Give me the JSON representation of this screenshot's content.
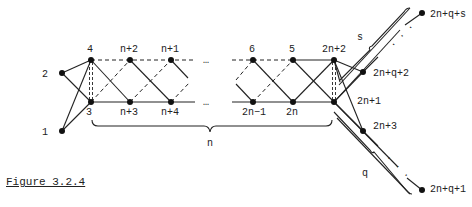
{
  "figure": {
    "caption": "Figure 3.2.4",
    "nodes": [
      {
        "id": "1",
        "label": "1",
        "x": 62,
        "y": 131
      },
      {
        "id": "2",
        "label": "2",
        "x": 62,
        "y": 73
      },
      {
        "id": "3",
        "label": "3",
        "x": 91,
        "y": 102
      },
      {
        "id": "4",
        "label": "4",
        "x": 91,
        "y": 60
      },
      {
        "id": "n+2",
        "label": "n+2",
        "x": 130,
        "y": 60
      },
      {
        "id": "n+3",
        "label": "n+3",
        "x": 130,
        "y": 102
      },
      {
        "id": "n+1",
        "label": "n+1",
        "x": 171,
        "y": 60
      },
      {
        "id": "n+4",
        "label": "n+4",
        "x": 171,
        "y": 102
      },
      {
        "id": "6",
        "label": "6",
        "x": 253,
        "y": 60
      },
      {
        "id": "2n-1",
        "label": "2n−1",
        "x": 253,
        "y": 102
      },
      {
        "id": "5",
        "label": "5",
        "x": 293,
        "y": 60
      },
      {
        "id": "2n",
        "label": "2n",
        "x": 293,
        "y": 102
      },
      {
        "id": "2n+2",
        "label": "2n+2",
        "x": 334,
        "y": 60
      },
      {
        "id": "2n+1",
        "label": "2n+1",
        "x": 334,
        "y": 102
      },
      {
        "id": "2n+q+2",
        "label": "2n+q+2",
        "x": 363,
        "y": 72
      },
      {
        "id": "2n+3",
        "label": "2n+3",
        "x": 363,
        "y": 131
      },
      {
        "id": "2n+q+s",
        "label": "2n+q+s",
        "x": 422,
        "y": 13
      },
      {
        "id": "2n+q+1",
        "label": "2n+q+1",
        "x": 422,
        "y": 190
      }
    ],
    "ellipsis": "…",
    "dots": ". . .",
    "brace_labels": {
      "n": "n",
      "s": "s",
      "q": "q"
    }
  }
}
